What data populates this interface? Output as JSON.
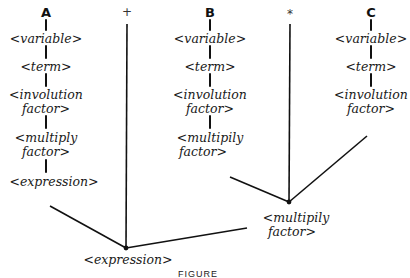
{
  "diagram": {
    "operands": {
      "A": {
        "label": "A",
        "nodes": [
          "<variable>",
          "<term>",
          "<involution",
          "factor>",
          "<multiply",
          "factor>",
          "<expression>"
        ]
      },
      "B": {
        "label": "B",
        "nodes": [
          "<variable>",
          "<term>",
          "<involution",
          "factor>",
          "<multipily",
          "factor>"
        ]
      },
      "C": {
        "label": "C",
        "nodes": [
          "<variable>",
          "<term>",
          "<involution",
          "factor>"
        ]
      }
    },
    "operators": {
      "plus": "+",
      "times": "*"
    },
    "merge_nodes": {
      "multiply_factor": [
        "<multipily",
        "factor>"
      ],
      "expression": "<expression>"
    },
    "caption": "FIGURE"
  }
}
